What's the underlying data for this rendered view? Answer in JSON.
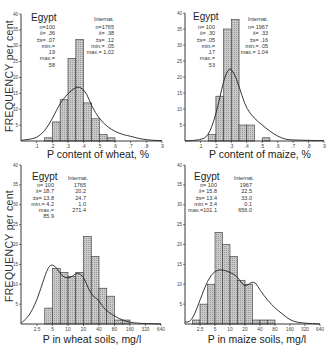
{
  "figure": {
    "y_axis_label": "FREQUENCY per cent"
  },
  "chart_data": [
    {
      "type": "bar",
      "panel": "top-left",
      "title": "Egypt",
      "xlabel": "P content of wheat, %",
      "ylabel": "FREQUENCY per cent",
      "ylim": [
        0,
        40
      ],
      "yticks": [
        5,
        10,
        15,
        20,
        25,
        30,
        35,
        40
      ],
      "xticks": [
        ".1",
        ".2",
        ".3",
        ".4",
        ".5",
        ".6",
        ".7",
        ".8",
        ".9"
      ],
      "xlim": [
        0,
        0.9
      ],
      "bins": [
        [
          0.15,
          0.2
        ],
        [
          0.2,
          0.25
        ],
        [
          0.25,
          0.3
        ],
        [
          0.3,
          0.35
        ],
        [
          0.35,
          0.4
        ],
        [
          0.4,
          0.45
        ],
        [
          0.45,
          0.5
        ],
        [
          0.5,
          0.55
        ],
        [
          0.55,
          0.6
        ]
      ],
      "values": [
        1,
        6,
        13,
        26,
        32,
        12,
        7,
        2,
        1
      ],
      "curve_label": "Internat.",
      "curve": [
        [
          0,
          0.2
        ],
        [
          0.05,
          0.5
        ],
        [
          0.1,
          1
        ],
        [
          0.15,
          3
        ],
        [
          0.2,
          7
        ],
        [
          0.25,
          12
        ],
        [
          0.3,
          15
        ],
        [
          0.35,
          17
        ],
        [
          0.38,
          17
        ],
        [
          0.42,
          15
        ],
        [
          0.45,
          11
        ],
        [
          0.5,
          7
        ],
        [
          0.55,
          4.5
        ],
        [
          0.6,
          3
        ],
        [
          0.65,
          2
        ],
        [
          0.7,
          1.5
        ],
        [
          0.75,
          0.8
        ],
        [
          0.8,
          0.4
        ],
        [
          0.85,
          0.2
        ],
        [
          0.9,
          0.1
        ]
      ],
      "stats": {
        "egypt": {
          "n": "n=100",
          "mean": "x̄= .36",
          "sd": "±s= .07",
          "min": "min.= .19",
          "max": "max.= .58"
        },
        "internat": {
          "label": "Internat.",
          "n": "n=1765",
          "mean": "x̄= .38",
          "sd": "±s= .12",
          "min": "min.= .05",
          "max": "max.= 1.02"
        }
      }
    },
    {
      "type": "bar",
      "panel": "top-right",
      "title": "Egypt",
      "xlabel": "P content of maize, %",
      "ylabel": "",
      "ylim": [
        0,
        40
      ],
      "yticks": [
        5,
        10,
        15,
        20,
        25,
        30,
        35,
        40
      ],
      "xticks": [
        ".1",
        ".2",
        ".3",
        ".4",
        ".5",
        ".6",
        ".7",
        ".8",
        ".9"
      ],
      "xlim": [
        0,
        0.9
      ],
      "bins": [
        [
          0.15,
          0.2
        ],
        [
          0.2,
          0.25
        ],
        [
          0.25,
          0.3
        ],
        [
          0.3,
          0.35
        ],
        [
          0.35,
          0.4
        ],
        [
          0.4,
          0.45
        ],
        [
          0.45,
          0.5
        ],
        [
          0.5,
          0.55
        ]
      ],
      "values": [
        2,
        14,
        35,
        38,
        5,
        5,
        0,
        1
      ],
      "curve_label": "Internat.",
      "curve": [
        [
          0,
          0
        ],
        [
          0.1,
          0.3
        ],
        [
          0.15,
          1.5
        ],
        [
          0.2,
          8
        ],
        [
          0.25,
          19
        ],
        [
          0.28,
          22.5
        ],
        [
          0.3,
          22.5
        ],
        [
          0.33,
          20
        ],
        [
          0.37,
          14
        ],
        [
          0.4,
          10
        ],
        [
          0.45,
          7
        ],
        [
          0.5,
          5
        ],
        [
          0.55,
          3
        ],
        [
          0.6,
          1.5
        ],
        [
          0.65,
          0.5
        ],
        [
          0.7,
          0.3
        ],
        [
          0.8,
          0.2
        ],
        [
          0.9,
          0.1
        ]
      ],
      "stats": {
        "egypt": {
          "n": "n= 100",
          "mean": "x̄= .30",
          "sd": "±s= .05",
          "min": "min.= .17",
          "max": "max.= .53"
        },
        "internat": {
          "label": "Internat.",
          "n": "n= 1967",
          "mean": "x̄= .33",
          "sd": "±s= .16",
          "min": "min.= .05",
          "max": "max.= 1.04"
        }
      }
    },
    {
      "type": "bar",
      "panel": "bottom-left",
      "title": "Egypt",
      "xlabel": "P in wheat soils, mg/l",
      "ylabel": "FREQUENCY per cent",
      "ylim": [
        0,
        40
      ],
      "yticks": [
        5,
        10,
        15,
        20,
        25,
        30,
        35,
        40
      ],
      "xticks": [
        "2.5",
        "5",
        "10",
        "20",
        "40",
        "80",
        "160",
        "320",
        "640"
      ],
      "x_scale": "log2",
      "bin_index_start": 0.5,
      "values": [
        4,
        14,
        13,
        12,
        13,
        22,
        17,
        9,
        7,
        1,
        1
      ],
      "curve_label": "Internat.",
      "curve": [
        [
          -1,
          0.3
        ],
        [
          -0.5,
          2
        ],
        [
          0,
          6
        ],
        [
          0.5,
          12
        ],
        [
          0.75,
          14.5
        ],
        [
          1,
          15
        ],
        [
          1.3,
          14
        ],
        [
          1.6,
          12
        ],
        [
          2,
          11.5
        ],
        [
          2.3,
          12
        ],
        [
          2.6,
          13
        ],
        [
          3,
          12
        ],
        [
          3.3,
          9
        ],
        [
          3.6,
          7
        ],
        [
          4,
          6
        ],
        [
          4.3,
          4
        ],
        [
          4.6,
          3
        ],
        [
          5,
          2
        ],
        [
          5.5,
          1
        ],
        [
          6,
          0.4
        ],
        [
          6.5,
          0.2
        ],
        [
          7,
          0.1
        ],
        [
          8,
          0
        ]
      ],
      "stats": {
        "egypt": {
          "n": "n= 100",
          "mean": "x̄= 18.7",
          "sd": "±s= 13.8",
          "min": "min.= 4.2",
          "max": "max.= 85.9"
        },
        "internat": {
          "label": "Internat.",
          "n": "1765",
          "mean": "20.2",
          "sd": "24.7",
          "min": "1.0",
          "max": "271.4"
        }
      }
    },
    {
      "type": "bar",
      "panel": "bottom-right",
      "title": "Egypt",
      "xlabel": "P in maize soils, mg/l",
      "ylabel": "",
      "ylim": [
        0,
        40
      ],
      "yticks": [
        5,
        10,
        15,
        20,
        25,
        30,
        35,
        40
      ],
      "xticks": [
        "2.5",
        "5",
        "10",
        "20",
        "40",
        "80",
        "160",
        "320",
        "640"
      ],
      "x_scale": "log2",
      "bin_index_start": -0.5,
      "values": [
        1,
        5,
        10,
        23,
        20,
        17,
        11,
        10,
        1,
        1,
        1
      ],
      "curve_label": "Internat.",
      "curve": [
        [
          -1,
          0.5
        ],
        [
          -0.7,
          0.5
        ],
        [
          -0.4,
          2
        ],
        [
          0,
          6
        ],
        [
          0.5,
          11
        ],
        [
          1,
          13.5
        ],
        [
          1.5,
          13.7
        ],
        [
          2,
          13
        ],
        [
          2.5,
          12
        ],
        [
          2.8,
          10
        ],
        [
          3.1,
          9.5
        ],
        [
          3.4,
          10.5
        ],
        [
          3.7,
          10.5
        ],
        [
          4,
          8.5
        ],
        [
          4.5,
          6
        ],
        [
          5,
          4
        ],
        [
          5.5,
          2.5
        ],
        [
          6,
          1
        ],
        [
          6.5,
          0.4
        ],
        [
          7,
          0.2
        ],
        [
          8,
          0
        ]
      ],
      "stats": {
        "egypt": {
          "n": "n= 100",
          "mean": "x̄= 15.8",
          "sd": "±s= 13.4",
          "min": "min.= 3.4",
          "max": "max.=101.1"
        },
        "internat": {
          "label": "Internat.",
          "n": "1967",
          "mean": "22.5",
          "sd": "33.0",
          "min": "0.1",
          "max": "656.0"
        }
      }
    }
  ]
}
